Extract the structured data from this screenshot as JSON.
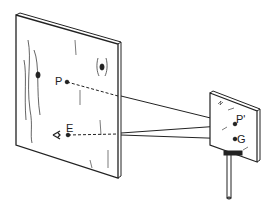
{
  "diagram": {
    "type": "optics-mirror-reflection",
    "labels": {
      "p": "P",
      "e": "E",
      "p_prime": "P'",
      "g": "G"
    },
    "colors": {
      "ink": "#222222",
      "background": "#ffffff"
    }
  }
}
